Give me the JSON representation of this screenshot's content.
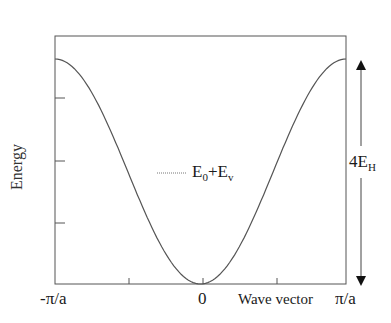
{
  "chart_data": {
    "type": "line",
    "title": "",
    "xlabel": "Wave vector",
    "ylabel": "Energy",
    "x_tick_labels": [
      "-π/a",
      "0",
      "π/a"
    ],
    "x": [
      -1.0,
      -0.75,
      -0.5,
      -0.25,
      0.0,
      0.25,
      0.5,
      0.75,
      1.0
    ],
    "x_units": "π/a",
    "series": [
      {
        "name": "E0+Ev",
        "description": "cosine band: E(k) = E0 + 2EH(1 - cos(ka))",
        "values": [
          4.0,
          3.41,
          2.0,
          0.59,
          0.0,
          0.59,
          2.0,
          3.41,
          4.0
        ],
        "values_units": "EH above band bottom"
      }
    ],
    "ylim": [
      0,
      4
    ],
    "grid": false,
    "legend": {
      "entry": "E0+Ev",
      "position": "center"
    },
    "annotations": [
      {
        "text": "4EH",
        "type": "double-arrow",
        "meaning": "bandwidth equals 4EH"
      }
    ]
  },
  "labels": {
    "ylabel": "Energy",
    "xlabel": "Wave vector",
    "x_left": "-π/a",
    "x_mid": "0",
    "x_right": "π/a",
    "legend_main1": "E",
    "legend_sub1": "0",
    "legend_plus": "+E",
    "legend_sub2": "v",
    "bandwidth_main": "4E",
    "bandwidth_sub": "H"
  }
}
